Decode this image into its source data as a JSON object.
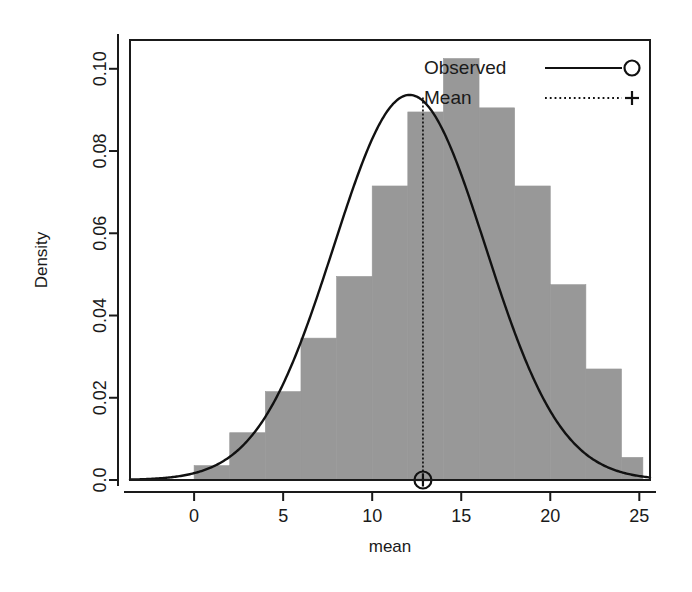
{
  "chart_data": {
    "type": "bar",
    "title": "",
    "subtitle": "",
    "xlabel": "mean",
    "ylabel": "Density",
    "xlim": [
      -3.6,
      25.6
    ],
    "ylim": [
      0.0,
      0.107
    ],
    "grid": false,
    "xticks": [
      0,
      5,
      10,
      15,
      20,
      25
    ],
    "xticklabels": [
      "0",
      "5",
      "10",
      "15",
      "20",
      "25"
    ],
    "yticks": [
      0.0,
      0.02,
      0.04,
      0.06,
      0.08,
      0.1
    ],
    "yticklabels": [
      "0.0",
      "0.02",
      "0.04",
      "0.06",
      "0.08",
      "0.10"
    ],
    "bin_width": 2,
    "bin_edges": [
      -2,
      0,
      2,
      4,
      6,
      8,
      10,
      12,
      14,
      16,
      18,
      20,
      22,
      24
    ],
    "bin_left_edges": [
      -2,
      0,
      2,
      4,
      6,
      8,
      10,
      12,
      14,
      16,
      18,
      20,
      22
    ],
    "bin_centers": [
      -1,
      1,
      3,
      5,
      7,
      9,
      11,
      13,
      15,
      17,
      19,
      21,
      23
    ],
    "histogram_values": [
      0.0,
      0.0035,
      0.0115,
      0.0215,
      0.0345,
      0.0495,
      0.0715,
      0.0895,
      0.1025,
      0.0905,
      0.0715,
      0.0475,
      0.027,
      0.0055
    ],
    "bars": [
      {
        "x0": -2,
        "x1": 0,
        "density": 0.0
      },
      {
        "x0": 0,
        "x1": 2,
        "density": 0.0035
      },
      {
        "x0": 2,
        "x1": 4,
        "density": 0.0115
      },
      {
        "x0": 4,
        "x1": 6,
        "density": 0.0215
      },
      {
        "x0": 6,
        "x1": 8,
        "density": 0.0345
      },
      {
        "x0": 8,
        "x1": 10,
        "density": 0.0495
      },
      {
        "x0": 10,
        "x1": 12,
        "density": 0.0715
      },
      {
        "x0": 12,
        "x1": 14,
        "density": 0.0895
      },
      {
        "x0": 14,
        "x1": 16,
        "density": 0.1025
      },
      {
        "x0": 16,
        "x1": 18,
        "density": 0.0905
      },
      {
        "x0": 18,
        "x1": 20,
        "density": 0.0715
      },
      {
        "x0": 20,
        "x1": 22,
        "density": 0.0475
      },
      {
        "x0": 22,
        "x1": 24,
        "density": 0.027
      },
      {
        "x0": 24,
        "x1": 25.2,
        "density": 0.0055
      }
    ],
    "series": [
      {
        "name": "Observed",
        "type": "line",
        "style": "solid",
        "marker": "circle",
        "distribution": "normal",
        "mean": 12.1,
        "sd": 4.26,
        "peak_density": 0.0936
      },
      {
        "name": "Mean",
        "type": "vline",
        "style": "dotted",
        "marker": "plus",
        "x": 12.85,
        "y_top": 0.093,
        "y_bottom": 0.0
      }
    ],
    "legend": {
      "position": "top-right",
      "entries": [
        {
          "label": "Observed",
          "line_style": "solid",
          "marker": "circle"
        },
        {
          "label": "Mean",
          "line_style": "dotted",
          "marker": "plus"
        }
      ]
    },
    "colors": {
      "bar_fill": "#989898",
      "bar_border": "#989898",
      "line": "#111111",
      "axis": "#1a1a1a",
      "background": "#ffffff"
    }
  }
}
